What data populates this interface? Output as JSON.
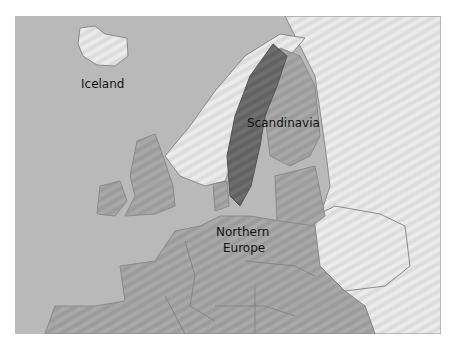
{
  "map": {
    "labels": {
      "iceland": "Iceland",
      "scandinavia": "Scandinavia",
      "northern_europe_line1": "Northern",
      "northern_europe_line2": "Europe"
    },
    "colors": {
      "sea": "#b9b9b9",
      "northern_europe": "#a3a3a3",
      "scandinavia_highlight": "#6a6a6a",
      "other_land": "#e6e6e6",
      "borders": "#8a8a8a"
    }
  }
}
